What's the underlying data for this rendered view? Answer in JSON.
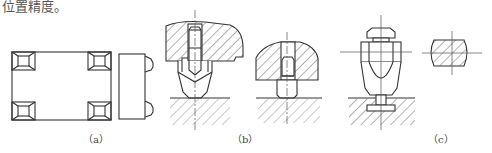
{
  "header_text": "位置精度。",
  "figures": [
    {
      "id": "a",
      "label": "（a）",
      "description": "workpiece plan view with four corner support pads and side view"
    },
    {
      "id": "b",
      "label": "（b）",
      "description": "two sectioned support pin variants contacting workpiece surface"
    },
    {
      "id": "c",
      "label": "（c）",
      "description": "adjustable support with nut and cross-section"
    }
  ],
  "colors": {
    "line": "#333333",
    "hatch": "#666666"
  }
}
